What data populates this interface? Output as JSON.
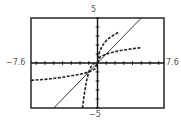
{
  "chart_data": {
    "type": "line",
    "title": "",
    "xlabel": "",
    "ylabel": "",
    "xlim": [
      -7.6,
      7.6
    ],
    "ylim": [
      -5,
      5
    ],
    "grid": false,
    "legend": null,
    "axis_labels": {
      "xmin": "−7.6",
      "xmax": "7.6",
      "ymin": "−5",
      "ymax": "5"
    },
    "ticks": {
      "x_step": 1,
      "y_step": 1
    },
    "series": [
      {
        "name": "y = x",
        "style": "solid",
        "x": [
          -5,
          -4,
          -3,
          -2,
          -1,
          0,
          1,
          2,
          3,
          4,
          5
        ],
        "y": [
          -5,
          -4,
          -3,
          -2,
          -1,
          0,
          1,
          2,
          3,
          4,
          5
        ]
      },
      {
        "name": "y = x^3",
        "style": "dashed",
        "x": [
          -1.71,
          -1.5,
          -1.25,
          -1,
          -0.75,
          -0.5,
          -0.25,
          0
        ],
        "y": [
          -5.0,
          -3.375,
          -1.953,
          -1,
          -0.422,
          -0.125,
          -0.016,
          0
        ]
      },
      {
        "name": "upper-right steep curve",
        "style": "dashed",
        "x": [
          0,
          0.1,
          0.25,
          0.5,
          0.75,
          1,
          1.5,
          2,
          2.4
        ],
        "y": [
          0,
          0.8,
          1.3,
          1.8,
          2.2,
          2.5,
          2.9,
          3.2,
          3.4
        ]
      },
      {
        "name": "y = x^(1/3)",
        "style": "dashed",
        "x": [
          -7.6,
          -6,
          -4,
          -2,
          -1,
          -0.3,
          0,
          0.3,
          1,
          2,
          3,
          4,
          5
        ],
        "y": [
          -1.92,
          -1.82,
          -1.59,
          -1.26,
          -1,
          -0.67,
          0,
          0.67,
          1,
          1.26,
          1.44,
          1.59,
          1.71
        ]
      }
    ]
  }
}
